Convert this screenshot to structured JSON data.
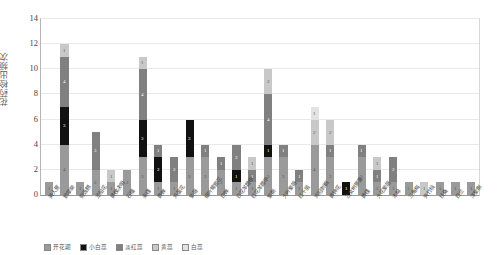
{
  "chart_data": {
    "type": "bar",
    "subtype": "stacked-column",
    "title": "",
    "xlabel": "",
    "ylabel": "花药检出频次",
    "ylim": [
      0,
      14
    ],
    "ytick_labels": [
      "0",
      "2",
      "4",
      "6",
      "8",
      "10",
      "12",
      "14"
    ],
    "ytick_values": [
      0,
      2,
      4,
      6,
      8,
      10,
      12,
      14
    ],
    "grid": true,
    "legend_position": "bottom",
    "categories": [
      "美人蕉",
      "鹅掌柴",
      "假连翘",
      "龙船花",
      "黄槐决明",
      "石榴",
      "朱槿",
      "黄蝉",
      "鸡蛋花",
      "紫薇",
      "细叶萼距花",
      "白蝉",
      "白花羊蹄甲",
      "红花羊蹄甲",
      "紫荆",
      "大叶紫薇",
      "红千层",
      "鸡冠刺桐",
      "黄钟花",
      "乙女树萝藦",
      "黄槿",
      "大花紫薇",
      "木棉",
      "三角梅",
      "夹竹桃",
      "扶桑",
      "白兰",
      "洋紫荆"
    ],
    "series": [
      {
        "name": "开花期",
        "color": "#9a9a9a",
        "values": [
          1,
          4,
          1,
          2,
          1,
          2,
          3,
          1,
          1,
          3,
          3,
          2,
          1,
          1,
          3,
          3,
          1,
          4,
          3,
          0,
          3,
          1,
          1,
          1,
          0,
          1,
          1,
          1
        ]
      },
      {
        "name": "小白蕊",
        "color": "#111111",
        "values": [
          0,
          3,
          0,
          0,
          0,
          0,
          3,
          2,
          0,
          3,
          0,
          0,
          1,
          0,
          1,
          0,
          0,
          0,
          0,
          1,
          0,
          0,
          0,
          0,
          0,
          0,
          0,
          0
        ]
      },
      {
        "name": "淡红蕊",
        "color": "#808080",
        "values": [
          0,
          4,
          0,
          3,
          0,
          0,
          4,
          1,
          2,
          0,
          1,
          1,
          2,
          1,
          4,
          1,
          1,
          0,
          1,
          0,
          1,
          1,
          2,
          0,
          0,
          0,
          0,
          0
        ]
      },
      {
        "name": "黄蕊",
        "color": "#c8c8c8",
        "values": [
          0,
          1,
          0,
          0,
          1,
          0,
          1,
          0,
          0,
          0,
          0,
          0,
          0,
          1,
          2,
          0,
          0,
          2,
          2,
          0,
          0,
          1,
          0,
          0,
          1,
          0,
          0,
          0
        ]
      },
      {
        "name": "白蕊",
        "color": "#e2e2e2",
        "values": [
          0,
          0,
          0,
          0,
          0,
          0,
          0,
          0,
          0,
          0,
          0,
          0,
          0,
          0,
          0,
          0,
          0,
          1,
          0,
          0,
          0,
          0,
          0,
          0,
          0,
          0,
          0,
          0
        ]
      }
    ],
    "bar_totals": [
      1,
      12,
      1,
      5,
      2,
      2,
      11,
      4,
      3,
      6,
      4,
      3,
      4,
      3,
      10,
      4,
      2,
      7,
      6,
      1,
      4,
      3,
      3,
      1,
      1,
      1,
      1,
      1
    ],
    "segment_labels": {
      "note": "Data labels printed inside segments show the per-segment count"
    }
  },
  "axis": {
    "y_title": "花药检出频次"
  },
  "legend": {
    "items": [
      {
        "label": "开花期",
        "color": "#9a9a9a"
      },
      {
        "label": "小白蕊",
        "color": "#111111"
      },
      {
        "label": "淡红蕊",
        "color": "#808080"
      },
      {
        "label": "黄蕊",
        "color": "#c8c8c8"
      },
      {
        "label": "白蕊",
        "color": "#e2e2e2"
      }
    ]
  }
}
